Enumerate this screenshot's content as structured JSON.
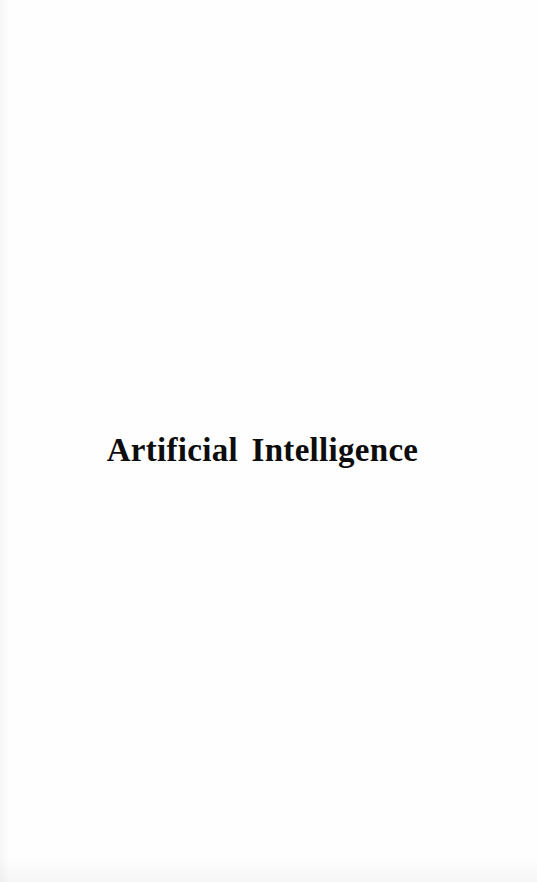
{
  "document": {
    "page_type": "half-title-page",
    "background_color": "#fefefe",
    "text_color": "#0d0d0d"
  },
  "title_block": {
    "heading": "Artificial Intelligence"
  }
}
